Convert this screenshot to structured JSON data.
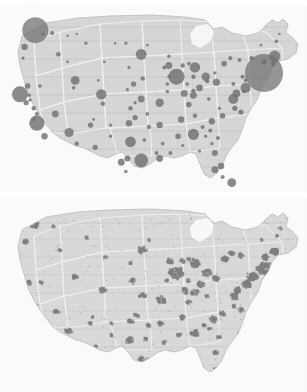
{
  "figure": {
    "title_remnant": "...  .  .",
    "background_color": "#ffffff",
    "land_color": "#d8d8d8",
    "land_edge_color": "#c2c2c2",
    "state_border_color": "#f2f2f2",
    "circle_color": "#6f6f6f",
    "urban_patch_color": "#808080",
    "panel_count": 2
  },
  "panels": [
    {
      "id": "panel-top",
      "name": "proportional-circle-map",
      "description": "United States map with proportional circles at metropolitan areas",
      "symbol_type": "circle"
    },
    {
      "id": "panel-bottom",
      "name": "urbanized-area-map",
      "description": "United States map with shaded urbanized area patches",
      "symbol_type": "patch"
    }
  ],
  "chart_data": {
    "type": "scatter",
    "title": "",
    "subtitle": "",
    "xlabel": "",
    "ylabel": "",
    "legend": [],
    "projection": "albers-usa",
    "maps": [
      {
        "name": "proportional-circle-map",
        "type": "scatter",
        "note": "Circle radius encodes magnitude at each metro location; coordinates are panel-relative percentages.",
        "points": [
          {
            "label": "Seattle",
            "x": 11.5,
            "y": 13.0,
            "r": 13.0
          },
          {
            "label": "Portland",
            "x": 8.0,
            "y": 22.0,
            "r": 3.2
          },
          {
            "label": "Spokane",
            "x": 17.0,
            "y": 14.5,
            "r": 2.0
          },
          {
            "label": "Boise",
            "x": 19.0,
            "y": 26.0,
            "r": 2.4
          },
          {
            "label": "San Francisco",
            "x": 6.5,
            "y": 47.5,
            "r": 8.0
          },
          {
            "label": "Sacramento",
            "x": 9.0,
            "y": 43.0,
            "r": 2.8
          },
          {
            "label": "San Jose",
            "x": 8.5,
            "y": 52.0,
            "r": 2.6
          },
          {
            "label": "Fresno",
            "x": 11.0,
            "y": 55.0,
            "r": 2.2
          },
          {
            "label": "Los Angeles",
            "x": 12.0,
            "y": 63.0,
            "r": 7.6
          },
          {
            "label": "San Diego",
            "x": 14.5,
            "y": 70.0,
            "r": 3.2
          },
          {
            "label": "Las Vegas",
            "x": 18.0,
            "y": 58.0,
            "r": 3.4
          },
          {
            "label": "Salt Lake City",
            "x": 24.5,
            "y": 40.0,
            "r": 4.4
          },
          {
            "label": "Reno",
            "x": 13.0,
            "y": 43.0,
            "r": 1.8
          },
          {
            "label": "Phoenix",
            "x": 22.5,
            "y": 68.0,
            "r": 4.6
          },
          {
            "label": "Tucson",
            "x": 25.0,
            "y": 74.0,
            "r": 2.2
          },
          {
            "label": "Albuquerque",
            "x": 29.5,
            "y": 64.0,
            "r": 2.6
          },
          {
            "label": "Denver",
            "x": 33.0,
            "y": 47.5,
            "r": 5.2
          },
          {
            "label": "Colorado Springs",
            "x": 33.5,
            "y": 52.5,
            "r": 2.2
          },
          {
            "label": "Billings",
            "x": 28.0,
            "y": 20.0,
            "r": 1.6
          },
          {
            "label": "Boise East",
            "x": 22.0,
            "y": 30.0,
            "r": 1.4
          },
          {
            "label": "El Paso",
            "x": 31.0,
            "y": 76.0,
            "r": 2.6
          },
          {
            "label": "Oklahoma City",
            "x": 42.0,
            "y": 63.0,
            "r": 3.2
          },
          {
            "label": "Tulsa",
            "x": 44.0,
            "y": 60.0,
            "r": 2.6
          },
          {
            "label": "Wichita",
            "x": 42.5,
            "y": 55.0,
            "r": 2.2
          },
          {
            "label": "Kansas City",
            "x": 46.0,
            "y": 50.0,
            "r": 3.4
          },
          {
            "label": "Omaha",
            "x": 43.5,
            "y": 42.0,
            "r": 2.6
          },
          {
            "label": "Des Moines",
            "x": 46.5,
            "y": 39.0,
            "r": 2.2
          },
          {
            "label": "Minneapolis",
            "x": 46.0,
            "y": 26.0,
            "r": 5.4
          },
          {
            "label": "Fargo",
            "x": 41.0,
            "y": 20.0,
            "r": 1.6
          },
          {
            "label": "Sioux Falls",
            "x": 42.0,
            "y": 33.0,
            "r": 1.6
          },
          {
            "label": "Dallas",
            "x": 42.5,
            "y": 73.0,
            "r": 5.4
          },
          {
            "label": "Austin",
            "x": 41.5,
            "y": 82.0,
            "r": 3.0
          },
          {
            "label": "San Antonio",
            "x": 39.5,
            "y": 84.0,
            "r": 3.4
          },
          {
            "label": "Houston",
            "x": 46.0,
            "y": 83.0,
            "r": 6.8
          },
          {
            "label": "New Orleans",
            "x": 52.0,
            "y": 82.0,
            "r": 3.4
          },
          {
            "label": "Baton Rouge",
            "x": 51.0,
            "y": 79.0,
            "r": 2.0
          },
          {
            "label": "Memphis",
            "x": 52.0,
            "y": 64.0,
            "r": 3.2
          },
          {
            "label": "Little Rock",
            "x": 48.5,
            "y": 65.0,
            "r": 2.2
          },
          {
            "label": "St. Louis",
            "x": 52.0,
            "y": 52.0,
            "r": 4.2
          },
          {
            "label": "Chicago",
            "x": 57.5,
            "y": 38.0,
            "r": 8.0
          },
          {
            "label": "Milwaukee",
            "x": 55.0,
            "y": 32.0,
            "r": 3.4
          },
          {
            "label": "Indianapolis",
            "x": 60.0,
            "y": 47.0,
            "r": 3.4
          },
          {
            "label": "Louisville",
            "x": 61.5,
            "y": 53.0,
            "r": 2.8
          },
          {
            "label": "Nashville",
            "x": 59.0,
            "y": 61.0,
            "r": 3.2
          },
          {
            "label": "Birmingham",
            "x": 58.0,
            "y": 70.0,
            "r": 2.8
          },
          {
            "label": "Atlanta",
            "x": 63.0,
            "y": 69.0,
            "r": 5.6
          },
          {
            "label": "Jacksonville",
            "x": 70.0,
            "y": 79.0,
            "r": 3.0
          },
          {
            "label": "Orlando",
            "x": 72.0,
            "y": 86.0,
            "r": 3.2
          },
          {
            "label": "Tampa",
            "x": 70.0,
            "y": 88.0,
            "r": 3.4
          },
          {
            "label": "Miami",
            "x": 75.5,
            "y": 95.0,
            "r": 4.4
          },
          {
            "label": "Charlotte",
            "x": 69.0,
            "y": 62.0,
            "r": 3.2
          },
          {
            "label": "Raleigh",
            "x": 72.5,
            "y": 59.0,
            "r": 2.8
          },
          {
            "label": "Charleston SC",
            "x": 71.0,
            "y": 71.0,
            "r": 2.0
          },
          {
            "label": "Columbia",
            "x": 68.5,
            "y": 67.0,
            "r": 2.0
          },
          {
            "label": "Greenville",
            "x": 66.0,
            "y": 65.0,
            "r": 2.0
          },
          {
            "label": "Knoxville",
            "x": 63.5,
            "y": 59.0,
            "r": 2.2
          },
          {
            "label": "Cincinnati",
            "x": 63.0,
            "y": 48.0,
            "r": 3.4
          },
          {
            "label": "Columbus",
            "x": 65.0,
            "y": 44.0,
            "r": 3.4
          },
          {
            "label": "Cleveland",
            "x": 67.0,
            "y": 38.0,
            "r": 4.2
          },
          {
            "label": "Detroit",
            "x": 63.5,
            "y": 33.0,
            "r": 5.2
          },
          {
            "label": "Pittsburgh",
            "x": 70.5,
            "y": 41.0,
            "r": 3.6
          },
          {
            "label": "Buffalo",
            "x": 73.0,
            "y": 31.0,
            "r": 2.8
          },
          {
            "label": "Rochester",
            "x": 75.0,
            "y": 28.0,
            "r": 2.2
          },
          {
            "label": "Washington DC",
            "x": 76.0,
            "y": 50.0,
            "r": 5.0
          },
          {
            "label": "Baltimore",
            "x": 77.0,
            "y": 47.0,
            "r": 3.8
          },
          {
            "label": "Richmond",
            "x": 76.5,
            "y": 55.0,
            "r": 2.6
          },
          {
            "label": "Virginia Beach",
            "x": 78.5,
            "y": 57.0,
            "r": 2.6
          },
          {
            "label": "Philadelphia",
            "x": 80.0,
            "y": 44.0,
            "r": 5.0
          },
          {
            "label": "New York",
            "x": 86.0,
            "y": 36.0,
            "r": 19.0
          },
          {
            "label": "Hartford",
            "x": 86.0,
            "y": 30.0,
            "r": 2.6
          },
          {
            "label": "Boston",
            "x": 89.5,
            "y": 27.0,
            "r": 5.6
          },
          {
            "label": "Providence",
            "x": 89.0,
            "y": 31.0,
            "r": 2.4
          },
          {
            "label": "Portland ME",
            "x": 90.0,
            "y": 19.0,
            "r": 1.8
          },
          {
            "label": "Syracuse",
            "x": 78.0,
            "y": 29.0,
            "r": 2.0
          },
          {
            "label": "Albany",
            "x": 82.0,
            "y": 28.0,
            "r": 2.2
          },
          {
            "label": "Harrisburg",
            "x": 76.0,
            "y": 42.0,
            "r": 2.0
          },
          {
            "label": "Grand Rapids",
            "x": 59.5,
            "y": 32.0,
            "r": 2.2
          },
          {
            "label": "Toledo",
            "x": 63.0,
            "y": 38.0,
            "r": 2.2
          },
          {
            "label": "Dayton",
            "x": 63.0,
            "y": 45.5,
            "r": 2.2
          },
          {
            "label": "Green Bay",
            "x": 55.0,
            "y": 27.0,
            "r": 1.8
          },
          {
            "label": "Madison",
            "x": 53.5,
            "y": 33.0,
            "r": 2.0
          },
          {
            "label": "Springfield IL",
            "x": 54.5,
            "y": 46.0,
            "r": 1.8
          },
          {
            "label": "Mobile",
            "x": 55.5,
            "y": 79.0,
            "r": 2.0
          },
          {
            "label": "Shreveport",
            "x": 47.0,
            "y": 72.0,
            "r": 1.8
          },
          {
            "label": "Corpus Christi",
            "x": 41.0,
            "y": 89.0,
            "r": 1.8
          },
          {
            "label": "Amarillo",
            "x": 36.0,
            "y": 64.0,
            "r": 1.6
          },
          {
            "label": "Lubbock",
            "x": 36.0,
            "y": 70.0,
            "r": 1.6
          },
          {
            "label": "Cheyenne",
            "x": 32.0,
            "y": 40.0,
            "r": 1.4
          },
          {
            "label": "Rapid City",
            "x": 34.0,
            "y": 30.0,
            "r": 1.4
          },
          {
            "label": "Eugene",
            "x": 7.5,
            "y": 28.0,
            "r": 1.6
          },
          {
            "label": "Bakersfield",
            "x": 12.0,
            "y": 58.0,
            "r": 2.0
          },
          {
            "label": "Stockton",
            "x": 9.5,
            "y": 48.0,
            "r": 1.8
          },
          {
            "label": "Tallahassee",
            "x": 65.0,
            "y": 78.0,
            "r": 1.6
          },
          {
            "label": "Savannah",
            "x": 69.0,
            "y": 74.0,
            "r": 1.6
          },
          {
            "label": "Ft Myers",
            "x": 72.5,
            "y": 92.0,
            "r": 2.0
          },
          {
            "label": "Scranton",
            "x": 79.0,
            "y": 38.0,
            "r": 2.0
          },
          {
            "label": "Allentown",
            "x": 80.0,
            "y": 40.0,
            "r": 1.8
          },
          {
            "label": "Wilmington",
            "x": 79.5,
            "y": 46.0,
            "r": 1.8
          },
          {
            "label": "Akron",
            "x": 67.5,
            "y": 40.5,
            "r": 2.0
          },
          {
            "label": "Lansing",
            "x": 61.5,
            "y": 31.0,
            "r": 1.8
          },
          {
            "label": "Fort Wayne",
            "x": 61.0,
            "y": 42.0,
            "r": 1.8
          },
          {
            "label": "Peoria",
            "x": 54.5,
            "y": 42.0,
            "r": 1.8
          },
          {
            "label": "Rockford",
            "x": 55.0,
            "y": 38.0,
            "r": 1.6
          },
          {
            "label": "Duluth",
            "x": 48.0,
            "y": 21.0,
            "r": 1.4
          },
          {
            "label": "Lincoln",
            "x": 41.5,
            "y": 45.0,
            "r": 1.6
          },
          {
            "label": "Topeka",
            "x": 44.0,
            "y": 52.0,
            "r": 1.6
          },
          {
            "label": "Springfield MO",
            "x": 48.0,
            "y": 58.0,
            "r": 1.8
          },
          {
            "label": "Jackson",
            "x": 53.0,
            "y": 74.0,
            "r": 1.8
          },
          {
            "label": "Montgomery",
            "x": 59.5,
            "y": 75.0,
            "r": 1.6
          },
          {
            "label": "Augusta",
            "x": 67.0,
            "y": 70.0,
            "r": 1.6
          },
          {
            "label": "Roanoke",
            "x": 71.5,
            "y": 55.0,
            "r": 1.6
          },
          {
            "label": "Charleston WV",
            "x": 68.0,
            "y": 50.0,
            "r": 1.8
          },
          {
            "label": "Erie",
            "x": 70.0,
            "y": 36.0,
            "r": 1.6
          },
          {
            "label": "Bangor",
            "x": 91.0,
            "y": 15.0,
            "r": 1.2
          },
          {
            "label": "Burlington",
            "x": 85.0,
            "y": 21.0,
            "r": 1.4
          },
          {
            "label": "Missoula",
            "x": 22.0,
            "y": 16.0,
            "r": 1.2
          },
          {
            "label": "Great Falls",
            "x": 25.0,
            "y": 15.0,
            "r": 1.2
          },
          {
            "label": "Bismarck",
            "x": 37.5,
            "y": 20.0,
            "r": 1.2
          },
          {
            "label": "Provo",
            "x": 24.0,
            "y": 44.0,
            "r": 1.8
          },
          {
            "label": "Santa Fe",
            "x": 30.5,
            "y": 61.0,
            "r": 1.4
          },
          {
            "label": "Modesto",
            "x": 9.8,
            "y": 50.5,
            "r": 1.6
          },
          {
            "label": "Santa Barbara",
            "x": 11.0,
            "y": 61.0,
            "r": 1.6
          },
          {
            "label": "Yakima",
            "x": 14.0,
            "y": 15.0,
            "r": 1.4
          }
        ]
      },
      {
        "name": "urbanized-area-map",
        "type": "scatter",
        "note": "Irregular shaded patches marking urbanized land; rendered as clustered speckle blobs."
      }
    ]
  }
}
